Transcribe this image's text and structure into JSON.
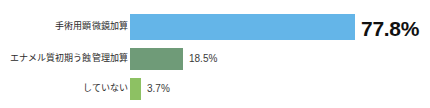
{
  "chart_data": {
    "type": "bar",
    "orientation": "horizontal",
    "title": "",
    "subtitle": "",
    "xlabel": "",
    "ylabel": "",
    "grid": false,
    "legend": null,
    "xlim": [
      0,
      100
    ],
    "value_unit": "%",
    "categories": [
      "手術用顕微鏡加算",
      "エナメル質初期う蝕管理加算",
      "していない"
    ],
    "values": [
      77.8,
      18.5,
      3.7
    ],
    "value_labels": [
      "77.8%",
      "18.5%",
      "3.7%"
    ],
    "colors": [
      "#64b5e8",
      "#6f9b78",
      "#8dc163"
    ],
    "bars": [
      {
        "label": "手術用顕微鏡加算",
        "value": 77.8,
        "value_label": "77.8%",
        "color": "#64b5e8",
        "pixel_width": 225
      },
      {
        "label": "エナメル質初期う蝕管理加算",
        "value": 18.5,
        "value_label": "18.5%",
        "color": "#6f9b78",
        "pixel_width": 53
      },
      {
        "label": "していない",
        "value": 3.7,
        "value_label": "3.7%",
        "color": "#8dc163",
        "pixel_width": 11
      }
    ]
  },
  "theme": {
    "background": "#ffffff",
    "label_color": "#2b2b2b",
    "value_color": "#3a3a3a",
    "emphasis_value_color": "#111111"
  }
}
